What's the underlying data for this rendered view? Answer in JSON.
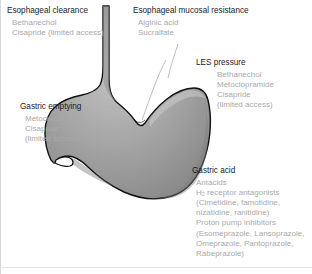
{
  "figure": {
    "type": "medical-diagram",
    "colors": {
      "organ_fill_light": "#c8c8c8",
      "organ_fill_mid": "#9a9a9a",
      "organ_fill_dark": "#8a8a8a",
      "organ_outline": "#111111",
      "title_text": "#1b1b1b",
      "drug_text": "#a9a9a9",
      "leader_line": "#b5b5b5",
      "page_background": "#ffffff"
    }
  },
  "callouts": {
    "esophageal_clearance": {
      "title": "Esophageal clearance",
      "drugs": [
        "Bethanechol",
        "Cisapride (limited access)"
      ]
    },
    "esophageal_mucosal_resistance": {
      "title": "Esophageal mucosal resistance",
      "drugs": [
        "Alginic acid",
        "Sucralfate"
      ]
    },
    "les_pressure": {
      "title": "LES pressure",
      "drugs": [
        "Bethanechol",
        "Metoclopramide",
        "Cisapride",
        "(limited access)"
      ]
    },
    "gastric_emptying": {
      "title": "Gastric emptying",
      "drugs": [
        "Metoclopramide",
        "Cisapride",
        "(limited access)"
      ]
    },
    "gastric_acid": {
      "title": "Gastric acid",
      "drugs": [
        "Antacids",
        "H₂ receptor antagonists",
        "(Cimetidine, famotidine,",
        "nizatidine, ranitidine)",
        "Proton pump inhibitors",
        "(Esomeprazole, Lansoprazole,",
        "Omeprazole, Pantoprazole,",
        "Rabeprazole)"
      ]
    }
  }
}
